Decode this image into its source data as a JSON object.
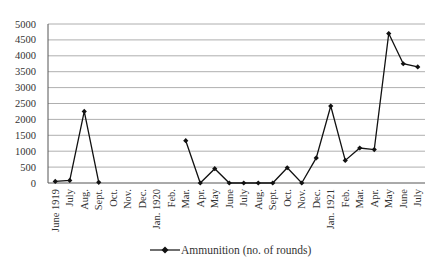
{
  "chart_data": {
    "type": "line",
    "title": "",
    "xlabel": "",
    "ylabel": "",
    "ylim": [
      0,
      5000
    ],
    "yticks": [
      0,
      500,
      1000,
      1500,
      2000,
      2500,
      3000,
      3500,
      4000,
      4500,
      5000
    ],
    "grid": true,
    "legend_position": "bottom",
    "categories": [
      "June 1919",
      "July",
      "Aug.",
      "Sept.",
      "Oct.",
      "Nov.",
      "Dec.",
      "Jan. 1920",
      "Feb.",
      "Mar.",
      "Apr.",
      "May",
      "June",
      "July",
      "Aug.",
      "Sept.",
      "Oct.",
      "Nov.",
      "Dec.",
      "Jan. 1921",
      "Feb.",
      "Mar.",
      "Apr.",
      "May",
      "June",
      "July"
    ],
    "series": [
      {
        "name": "Ammunition (no. of rounds)",
        "color": "#111111",
        "marker": "diamond",
        "values": [
          50,
          80,
          2250,
          20,
          null,
          null,
          null,
          null,
          null,
          1330,
          0,
          450,
          0,
          0,
          0,
          0,
          480,
          0,
          790,
          2420,
          710,
          1100,
          1050,
          4700,
          3750,
          3650
        ]
      }
    ]
  },
  "legend": {
    "label": "Ammunition (no. of rounds)"
  }
}
